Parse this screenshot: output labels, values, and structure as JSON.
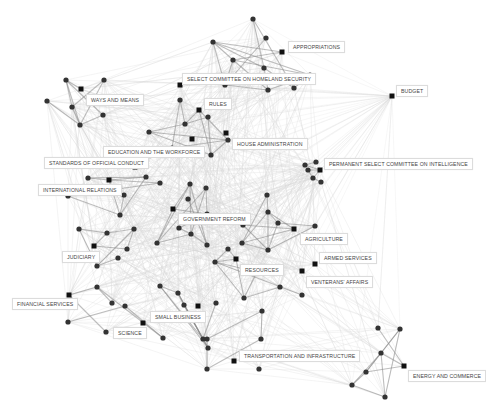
{
  "diagram": {
    "type": "network",
    "colors": {
      "edge_light": "#d8d8d8",
      "edge_dark": "#888888",
      "node": "#333333",
      "committee_node": "#111111",
      "label_border": "#dcdcdc"
    },
    "committees": [
      {
        "id": "appropriations",
        "label": "APPROPRIATIONS",
        "x": 282,
        "y": 52,
        "lx": 288,
        "ly": 41
      },
      {
        "id": "homeland",
        "label": "SELECT COMMITTEE ON HOMELAND SECURITY",
        "x": 180,
        "y": 85,
        "lx": 182,
        "ly": 73
      },
      {
        "id": "budget",
        "label": "BUDGET",
        "x": 392,
        "y": 96,
        "lx": 396,
        "ly": 85
      },
      {
        "id": "ways",
        "label": "WAYS AND MEANS",
        "x": 81,
        "y": 89,
        "lx": 86,
        "ly": 94
      },
      {
        "id": "rules",
        "label": "RULES",
        "x": 199,
        "y": 110,
        "lx": 204,
        "ly": 98
      },
      {
        "id": "house_admin",
        "label": "HOUSE ADMINISTRATION",
        "x": 226,
        "y": 133,
        "lx": 232,
        "ly": 138
      },
      {
        "id": "education",
        "label": "EDUCATION AND THE WORKFORCE",
        "x": 192,
        "y": 139,
        "lx": 103,
        "ly": 146
      },
      {
        "id": "intelligence",
        "label": "PERMANENT SELECT COMMITTEE ON INTELLIGENCE",
        "x": 320,
        "y": 170,
        "lx": 324,
        "ly": 158
      },
      {
        "id": "standards",
        "label": "STANDARDS OF OFFICIAL CONDUCT",
        "x": 135,
        "y": 167,
        "lx": 44,
        "ly": 157
      },
      {
        "id": "international",
        "label": "INTERNATIONAL RELATIONS",
        "x": 109,
        "y": 180,
        "lx": 38,
        "ly": 184
      },
      {
        "id": "gov_reform",
        "label": "GOVERNMENT REFORM",
        "x": 173,
        "y": 209,
        "lx": 178,
        "ly": 213
      },
      {
        "id": "agriculture",
        "label": "AGRICULTURE",
        "x": 294,
        "y": 229,
        "lx": 300,
        "ly": 233
      },
      {
        "id": "judiciary",
        "label": "JUDICIARY",
        "x": 94,
        "y": 246,
        "lx": 62,
        "ly": 251
      },
      {
        "id": "armed",
        "label": "ARMED SERVICES",
        "x": 315,
        "y": 264,
        "lx": 319,
        "ly": 252
      },
      {
        "id": "resources",
        "label": "RESOURCES",
        "x": 236,
        "y": 259,
        "lx": 240,
        "ly": 264
      },
      {
        "id": "veterans",
        "label": "VENTERANS' AFFAIRS",
        "x": 302,
        "y": 271,
        "lx": 306,
        "ly": 276
      },
      {
        "id": "financial",
        "label": "FINANCIAL SERVICES",
        "x": 69,
        "y": 295,
        "lx": 12,
        "ly": 298
      },
      {
        "id": "small_business",
        "label": "SMALL BUSINESS",
        "x": 198,
        "y": 306,
        "lx": 150,
        "ly": 311
      },
      {
        "id": "science",
        "label": "SCIENCE",
        "x": 143,
        "y": 323,
        "lx": 113,
        "ly": 327
      },
      {
        "id": "transport",
        "label": "TRANSPORTATION AND INFRASTRUCTURE",
        "x": 234,
        "y": 361,
        "lx": 239,
        "ly": 350
      },
      {
        "id": "energy",
        "label": "ENERGY AND COMMERCE",
        "x": 404,
        "y": 366,
        "lx": 408,
        "ly": 370
      }
    ]
  }
}
